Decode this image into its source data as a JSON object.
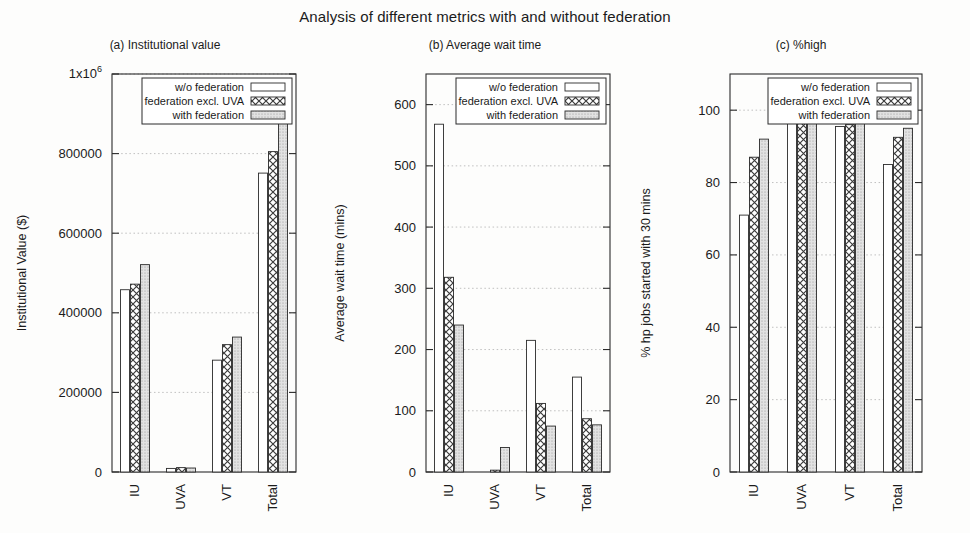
{
  "figure": {
    "title": "Analysis of different metrics with and without federation",
    "series_names": [
      "w/o federation",
      "federation excl. UVA",
      "with federation"
    ],
    "categories": [
      "IU",
      "UVA",
      "VT",
      "Total"
    ]
  },
  "chart_data": [
    {
      "type": "bar",
      "title": "(a) Institutional value",
      "xlabel": "",
      "ylabel": "Institutional Value ($)",
      "categories": [
        "IU",
        "UVA",
        "VT",
        "Total"
      ],
      "series": [
        {
          "name": "w/o federation",
          "values": [
            458000,
            9000,
            281000,
            751000
          ]
        },
        {
          "name": "federation excl. UVA",
          "values": [
            472000,
            11000,
            320000,
            805000
          ]
        },
        {
          "name": "with federation",
          "values": [
            521000,
            10000,
            339000,
            892000
          ]
        }
      ],
      "ylim": [
        0,
        1000000
      ],
      "yticks": [
        0,
        200000,
        400000,
        600000,
        800000,
        1000000
      ],
      "ytick_labels": [
        "0",
        "200000",
        "400000",
        "600000",
        "800000",
        "1x10^6"
      ],
      "grid": true,
      "legend_position": "top-right"
    },
    {
      "type": "bar",
      "title": "(b) Average wait time",
      "xlabel": "",
      "ylabel": "Average wait time (mins)",
      "categories": [
        "IU",
        "UVA",
        "VT",
        "Total"
      ],
      "series": [
        {
          "name": "w/o federation",
          "values": [
            568,
            0,
            215,
            155
          ]
        },
        {
          "name": "federation excl. UVA",
          "values": [
            318,
            3,
            112,
            87
          ]
        },
        {
          "name": "with federation",
          "values": [
            240,
            40,
            75,
            77
          ]
        }
      ],
      "ylim": [
        0,
        650
      ],
      "yticks": [
        0,
        100,
        200,
        300,
        400,
        500,
        600
      ],
      "ytick_labels": [
        "0",
        "100",
        "200",
        "300",
        "400",
        "500",
        "600"
      ],
      "grid": true,
      "legend_position": "top-right"
    },
    {
      "type": "bar",
      "title": "(c) %high",
      "xlabel": "",
      "ylabel": "% hp jobs started with 30 mins",
      "categories": [
        "IU",
        "UVA",
        "VT",
        "Total"
      ],
      "series": [
        {
          "name": "w/o federation",
          "values": [
            71,
            100,
            95.5,
            85
          ]
        },
        {
          "name": "federation excl. UVA",
          "values": [
            87,
            100,
            96,
            92.5
          ]
        },
        {
          "name": "with federation",
          "values": [
            92,
            99,
            97.5,
            95
          ]
        }
      ],
      "ylim": [
        0,
        110
      ],
      "yticks": [
        0,
        20,
        40,
        60,
        80,
        100
      ],
      "ytick_labels": [
        "0",
        "20",
        "40",
        "60",
        "80",
        "100"
      ],
      "grid": true,
      "legend_position": "top-right"
    }
  ]
}
